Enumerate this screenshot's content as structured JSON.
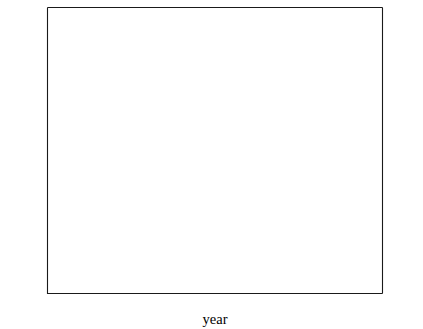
{
  "chart_data": {
    "type": "line",
    "title": "",
    "subtitle": "",
    "xlabel": "year",
    "ylabel": "SO2 emissions, Tg S y-1",
    "ylabel_right": "CO2 production, Pg C y-1",
    "xlim": [
      1855,
      1982
    ],
    "ylim": [
      0,
      112
    ],
    "ylim_right": [
      0,
      5.6
    ],
    "grid": false,
    "legend": "none",
    "x_ticks_major": [
      1860,
      1880,
      1900,
      1920,
      1940,
      1960,
      1980
    ],
    "x_ticks_major_labels": [
      "1860",
      "1880",
      "1900",
      "1920",
      "1940",
      "1960",
      "1980"
    ],
    "x_ticks_minor": [
      1870,
      1890,
      1910,
      1930,
      1950,
      1970
    ],
    "y_ticks_major_left": [
      50,
      100
    ],
    "y_ticks_major_left_labels": [
      "50",
      "100"
    ],
    "y_ticks_minor_left": [
      10,
      20,
      30,
      40,
      60,
      70,
      80,
      90,
      110
    ],
    "y_ticks_major_right": [
      1,
      2,
      3,
      4,
      5
    ],
    "y_ticks_major_right_labels": [
      "1",
      "2",
      "3",
      "4",
      "5"
    ],
    "y_ticks_minor_right": [
      0.5,
      1.5,
      2.5,
      3.5,
      4.5
    ],
    "series": [
      {
        "name": "CO2 production, Pg C y-1",
        "marker": "none",
        "style": "solid-line",
        "axis": "right",
        "x": [
          1860,
          1865,
          1870,
          1875,
          1880,
          1885,
          1890,
          1895,
          1900,
          1905,
          1910,
          1912,
          1914,
          1916,
          1918,
          1920,
          1922,
          1924,
          1926,
          1928,
          1930,
          1932,
          1934,
          1936,
          1938,
          1940,
          1942,
          1944,
          1945,
          1946,
          1948,
          1950,
          1952,
          1954,
          1956,
          1958,
          1960,
          1962,
          1964,
          1966,
          1968,
          1970,
          1972,
          1974,
          1976
        ],
        "values": [
          0.09,
          0.12,
          0.16,
          0.21,
          0.28,
          0.35,
          0.44,
          0.54,
          0.65,
          0.78,
          0.94,
          0.95,
          0.93,
          0.95,
          0.93,
          0.96,
          0.94,
          0.98,
          1.01,
          1.06,
          1.05,
          0.94,
          0.95,
          1.04,
          1.08,
          1.15,
          1.22,
          1.28,
          1.22,
          1.3,
          1.6,
          1.93,
          2.05,
          2.2,
          2.5,
          2.7,
          2.9,
          3.2,
          3.5,
          3.85,
          4.15,
          4.45,
          4.75,
          5.05,
          5.15
        ]
      },
      {
        "name": "SO2 emissions, Tg S y-1",
        "marker": "circle",
        "style": "markers",
        "axis": "left",
        "x": [
          1860,
          1870,
          1880,
          1890,
          1900,
          1910,
          1920,
          1930,
          1940,
          1950,
          1960,
          1965
        ],
        "values": [
          3.0,
          5.0,
          8.0,
          11.5,
          16.0,
          21.0,
          25.5,
          28.5,
          33.5,
          40.0,
          65.0,
          73.0
        ]
      },
      {
        "name": "SO2 emissions recent, Tg S y-1",
        "marker": "diamond",
        "style": "markers",
        "axis": "left",
        "x": [
          1970,
          1973,
          1974,
          1976
        ],
        "values": [
          83.0,
          90.0,
          91.5,
          103.0
        ]
      }
    ],
    "annotations": []
  },
  "axes": {
    "x_title": "year",
    "left_title_parts": {
      "pre": "SO",
      "sub": "2",
      "mid": " emissions, Tg S y",
      "sup": "-1"
    },
    "right_title_parts": {
      "pre": "CO",
      "sub": "2",
      "mid": " production, Pg C y",
      "sup": "-1"
    }
  },
  "colors": {
    "line": "#000000",
    "marker": "#000000",
    "axis": "#1a1a1a",
    "background": "#ffffff",
    "tick_label": "#2b2b2b"
  }
}
